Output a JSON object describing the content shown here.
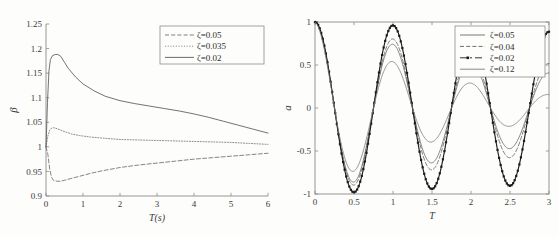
{
  "page": {
    "background_color": "#fdfdfc",
    "ink_color": "#3a3a3a"
  },
  "chart_data": [
    {
      "id": "left",
      "type": "line",
      "title": "",
      "xlabel": "T(s)",
      "ylabel": "β",
      "xlim": [
        0,
        6
      ],
      "ylim": [
        0.9,
        1.25
      ],
      "xticks": [
        "0",
        "1",
        "2",
        "3",
        "4",
        "5",
        "6"
      ],
      "xtick_values": [
        0,
        1,
        2,
        3,
        4,
        5,
        6
      ],
      "yticks": [
        "0.9",
        "0.95",
        "1",
        "1.05",
        "1.1",
        "1.15",
        "1.2",
        "1.25"
      ],
      "ytick_values": [
        0.9,
        0.95,
        1.0,
        1.05,
        1.1,
        1.15,
        1.2,
        1.25
      ],
      "grid": false,
      "legend_position": "top-right",
      "legend": [
        "ζ=0.05",
        "ζ=0.035",
        "ζ=0.02"
      ],
      "series": [
        {
          "name": "ζ=0.05",
          "style": "dashed",
          "color": "#6f6f6f",
          "x": [
            0,
            0.05,
            0.1,
            0.15,
            0.2,
            0.3,
            0.4,
            0.5,
            0.7,
            0.9,
            1.2,
            1.5,
            2.0,
            2.5,
            3.0,
            3.5,
            4.0,
            4.5,
            5.0,
            5.5,
            6.0
          ],
          "y": [
            1.0,
            0.985,
            0.955,
            0.938,
            0.932,
            0.93,
            0.93,
            0.932,
            0.936,
            0.94,
            0.946,
            0.951,
            0.958,
            0.963,
            0.967,
            0.971,
            0.975,
            0.978,
            0.981,
            0.984,
            0.987
          ]
        },
        {
          "name": "ζ=0.035",
          "style": "dotted",
          "color": "#7a7a7a",
          "x": [
            0,
            0.05,
            0.1,
            0.15,
            0.2,
            0.3,
            0.4,
            0.5,
            0.7,
            0.9,
            1.2,
            1.5,
            2.0,
            2.5,
            3.0,
            3.5,
            4.0,
            4.5,
            5.0,
            5.5,
            6.0
          ],
          "y": [
            1.0,
            1.022,
            1.034,
            1.038,
            1.039,
            1.037,
            1.034,
            1.031,
            1.026,
            1.023,
            1.02,
            1.018,
            1.015,
            1.014,
            1.013,
            1.012,
            1.011,
            1.01,
            1.009,
            1.007,
            1.005
          ]
        },
        {
          "name": "ζ=0.02",
          "style": "solid",
          "color": "#5a5a5a",
          "x": [
            0,
            0.04,
            0.08,
            0.12,
            0.18,
            0.25,
            0.32,
            0.4,
            0.5,
            0.6,
            0.8,
            1.0,
            1.3,
            1.6,
            2.0,
            2.4,
            2.8,
            3.2,
            3.6,
            4.0,
            4.4,
            4.8,
            5.2,
            5.6,
            6.0
          ],
          "y": [
            1.0,
            1.09,
            1.155,
            1.178,
            1.186,
            1.188,
            1.188,
            1.184,
            1.172,
            1.16,
            1.142,
            1.128,
            1.114,
            1.103,
            1.094,
            1.088,
            1.083,
            1.078,
            1.073,
            1.067,
            1.06,
            1.052,
            1.044,
            1.036,
            1.028
          ]
        }
      ]
    },
    {
      "id": "right",
      "type": "line",
      "title": "",
      "xlabel": "T",
      "ylabel": "a",
      "xlim": [
        0,
        3
      ],
      "ylim": [
        -1,
        1
      ],
      "xticks": [
        "0",
        "0.5",
        "1",
        "1.5",
        "2",
        "2.5",
        "3"
      ],
      "xtick_values": [
        0,
        0.5,
        1,
        1.5,
        2,
        2.5,
        3
      ],
      "yticks": [
        "-1",
        "-0.5",
        "0",
        "0.5",
        "1"
      ],
      "ytick_values": [
        -1,
        -0.5,
        0,
        0.5,
        1
      ],
      "grid": false,
      "legend_position": "top-right",
      "legend": [
        "ζ=0.05",
        "ζ=0.04",
        "ζ=0.02",
        "ζ=0.12"
      ],
      "series": [
        {
          "name": "ζ=0.05",
          "style": "solid",
          "color": "#6a6a6a",
          "decay": 0.3,
          "period": 1.0,
          "amplitude": 1.0
        },
        {
          "name": "ζ=0.04",
          "style": "dashed",
          "color": "#5e5e5e",
          "decay": 0.22,
          "period": 1.0,
          "amplitude": 1.0
        },
        {
          "name": "ζ=0.02",
          "style": "dash-dot-marker",
          "color": "#1c1c1c",
          "decay": 0.04,
          "period": 1.0,
          "amplitude": 1.0
        },
        {
          "name": "ζ=0.12",
          "style": "solid",
          "color": "#7d7d7d",
          "decay": 0.62,
          "period": 1.0,
          "amplitude": 1.0
        }
      ]
    }
  ]
}
